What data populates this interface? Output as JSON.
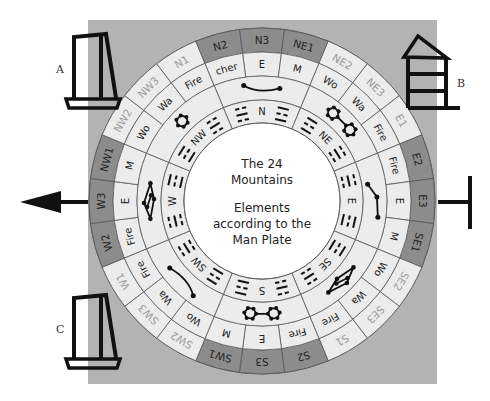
{
  "diagram": {
    "center_text": {
      "title_line1": "The 24",
      "title_line2": "Mountains",
      "subtitle_line1": "Elements",
      "subtitle_line2": "according to the",
      "subtitle_line3": "Man Plate"
    },
    "colors": {
      "panel_bg": "#b3b3b3",
      "ring_light": "#ececec",
      "ring_dark": "#8c8c8c",
      "line": "#555555",
      "ink": "#111111",
      "faded_text": "#9a9a9a"
    },
    "mountains": [
      {
        "angle": 0,
        "label": "N3",
        "dark": true,
        "element": "E"
      },
      {
        "angle": 15,
        "label": "NE1",
        "dark": true,
        "element": "M"
      },
      {
        "angle": 30,
        "label": "NE2",
        "dark": false,
        "element": "Wo"
      },
      {
        "angle": 45,
        "label": "NE3",
        "dark": false,
        "element": "Wa"
      },
      {
        "angle": 60,
        "label": "E1",
        "dark": false,
        "element": "Fire"
      },
      {
        "angle": 75,
        "label": "E2",
        "dark": true,
        "element": "Fire"
      },
      {
        "angle": 90,
        "label": "E3",
        "dark": true,
        "element": "E"
      },
      {
        "angle": 105,
        "label": "SE1",
        "dark": true,
        "element": "M"
      },
      {
        "angle": 120,
        "label": "SE2",
        "dark": false,
        "element": "Wo"
      },
      {
        "angle": 135,
        "label": "SE3",
        "dark": false,
        "element": "Wa"
      },
      {
        "angle": 150,
        "label": "S1",
        "dark": false,
        "element": "Fire"
      },
      {
        "angle": 165,
        "label": "S2",
        "dark": true,
        "element": "Fire"
      },
      {
        "angle": 180,
        "label": "S3",
        "dark": true,
        "element": "E"
      },
      {
        "angle": 195,
        "label": "SW1",
        "dark": true,
        "element": "M"
      },
      {
        "angle": 210,
        "label": "SW2",
        "dark": false,
        "element": "Wo"
      },
      {
        "angle": 225,
        "label": "SW3",
        "dark": false,
        "element": "Wa"
      },
      {
        "angle": 240,
        "label": "W1",
        "dark": false,
        "element": "Fire"
      },
      {
        "angle": 255,
        "label": "W2",
        "dark": true,
        "element": "Fire"
      },
      {
        "angle": 270,
        "label": "W3",
        "dark": true,
        "element": "E"
      },
      {
        "angle": 285,
        "label": "NW1",
        "dark": true,
        "element": "M"
      },
      {
        "angle": 300,
        "label": "NW2",
        "dark": false,
        "element": "Wo"
      },
      {
        "angle": 315,
        "label": "NW3",
        "dark": false,
        "element": "Wa"
      },
      {
        "angle": 330,
        "label": "N1",
        "dark": false,
        "element": "Fire"
      },
      {
        "angle": 345,
        "label": "N2",
        "dark": true,
        "element": "cher"
      }
    ],
    "directions": [
      {
        "angle": 0,
        "label": "N"
      },
      {
        "angle": 45,
        "label": "NE"
      },
      {
        "angle": 90,
        "label": "E"
      },
      {
        "angle": 135,
        "label": "SE"
      },
      {
        "angle": 180,
        "label": "S"
      },
      {
        "angle": 225,
        "label": "SW"
      },
      {
        "angle": 270,
        "label": "W"
      },
      {
        "angle": 315,
        "label": "NW"
      }
    ],
    "star_groups": [
      {
        "angle": 0,
        "type": "curve"
      },
      {
        "angle": 45,
        "type": "double-hex"
      },
      {
        "angle": 90,
        "type": "chain"
      },
      {
        "angle": 135,
        "type": "diamond"
      },
      {
        "angle": 180,
        "type": "double-hex"
      },
      {
        "angle": 225,
        "type": "curve"
      },
      {
        "angle": 270,
        "type": "diamond"
      },
      {
        "angle": 315,
        "type": "hex"
      }
    ]
  },
  "buildings": {
    "a_label": "A",
    "b_label": "B",
    "c_label": "C"
  }
}
